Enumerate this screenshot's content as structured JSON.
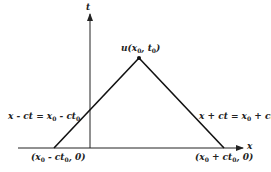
{
  "diagram": {
    "axes": {
      "x_label": "x",
      "t_label": "t"
    },
    "apex": {
      "label_pre": "u(x",
      "label_sub1": "0",
      "label_mid": ", t",
      "label_sub2": "0",
      "label_post": ")"
    },
    "left_characteristic": {
      "eq_pre": "x - ct = x",
      "eq_sub1": "0",
      "eq_mid": " - ct",
      "eq_sub2": "0",
      "eq_post": ""
    },
    "right_characteristic": {
      "eq_pre": "x + ct = x",
      "eq_sub1": "0",
      "eq_mid": " + ct",
      "eq_sub2": "0",
      "eq_post": ""
    },
    "left_base": {
      "pt_pre": "(x",
      "pt_sub1": "0",
      "pt_mid": " - ct",
      "pt_sub2": "0",
      "pt_post": ", 0)"
    },
    "right_base": {
      "pt_pre": "(x",
      "pt_sub1": "0",
      "pt_mid": " + ct",
      "pt_sub2": "0",
      "pt_post": ", 0)"
    },
    "colors": {
      "ink": "#222222",
      "background": "#ffffff"
    }
  }
}
